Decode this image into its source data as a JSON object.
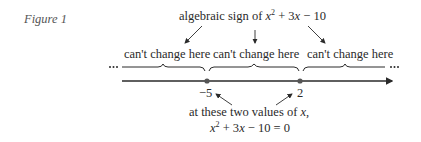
{
  "figure_label": "Figure 1",
  "top_annotation": {
    "prefix": "algebraic sign of ",
    "expression": {
      "var": "x",
      "exp": "2",
      "rest_a": " + 3",
      "var2": "x",
      "rest_b": " − 10"
    }
  },
  "regions": [
    {
      "label": "can't change here"
    },
    {
      "label": "can't change here"
    },
    {
      "label": "can't change here"
    }
  ],
  "number_line": {
    "points": [
      {
        "value": "−5"
      },
      {
        "value": "2"
      }
    ],
    "left_ellipsis": "…",
    "right_ellipsis": "…"
  },
  "bottom_annotation": {
    "line1_prefix": "at these two values of ",
    "line1_var": "x",
    "line1_suffix": ",",
    "line2": {
      "var": "x",
      "exp": "2",
      "rest_a": " + 3",
      "var2": "x",
      "rest_b": " − 10 = 0"
    }
  },
  "colors": {
    "line": "#2a2a2a",
    "point": "#555555",
    "figure_label": "#555555"
  }
}
